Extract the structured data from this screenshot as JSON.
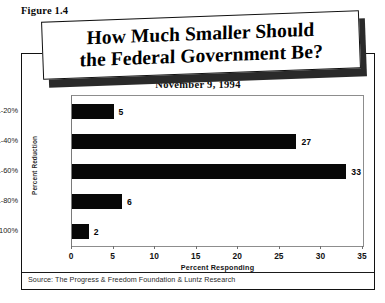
{
  "figure": {
    "caption": "Figure 1.4"
  },
  "title": {
    "line1": "How Much Smaller Should",
    "line2": "the Federal Government Be?"
  },
  "subtitle": "November 9, 1994",
  "source": "Source: The Progress & Freedom Foundation & Luntz Research",
  "colors": {
    "bar": "#080808",
    "frame": "#121212",
    "plot_border": "#8d8d8d",
    "background": "#ffffff"
  },
  "chart_data": {
    "type": "bar",
    "orientation": "horizontal",
    "title": "How Much Smaller Should the Federal Government Be?",
    "subtitle": "November 9, 1994",
    "xlabel": "Percent Responding",
    "ylabel": "Percent Reduction",
    "categories": [
      "1-20%",
      "21-40%",
      "41-60%",
      "61-80%",
      "81-100%"
    ],
    "values": [
      5,
      27,
      33,
      6,
      2
    ],
    "data_labels": [
      "5",
      "27",
      "33",
      "6",
      "2"
    ],
    "xlim": [
      0,
      35
    ],
    "xticks": [
      0,
      5,
      10,
      15,
      20,
      25,
      30,
      35
    ],
    "xtick_labels": [
      "0",
      "5",
      "10",
      "15",
      "20",
      "25",
      "30",
      "35"
    ],
    "grid": false,
    "legend": false,
    "source": "Source: The Progress & Freedom Foundation & Luntz Research"
  }
}
